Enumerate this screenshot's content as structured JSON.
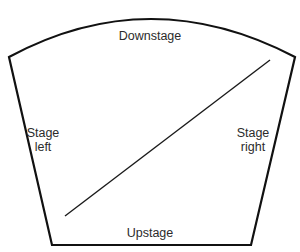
{
  "diagram": {
    "type": "stage-layout",
    "labels": {
      "downstage": "Downstage",
      "upstage": "Upstage",
      "stage_left": {
        "line1": "Stage",
        "line2": "left"
      },
      "stage_right": {
        "line1": "Stage",
        "line2": "right"
      }
    },
    "colors": {
      "outline": "#111111",
      "diagonal": "#1a1a1a",
      "text": "#2b2b2b",
      "background": "#ffffff"
    },
    "shape": {
      "top_left": [
        9,
        57
      ],
      "top_right": [
        295,
        57
      ],
      "arc_peak": [
        150,
        19
      ],
      "bottom_left": [
        52,
        245
      ],
      "bottom_right": [
        251,
        245
      ]
    },
    "diagonal": {
      "from": [
        65,
        216
      ],
      "to": [
        270,
        60
      ]
    }
  }
}
